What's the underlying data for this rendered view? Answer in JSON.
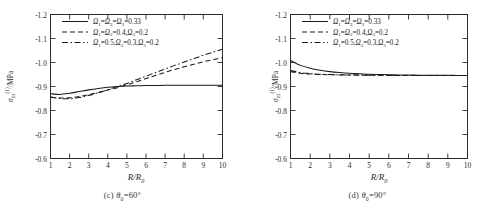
{
  "figure": {
    "panels": [
      {
        "id": "panel-c",
        "caption_prefix": "(c)",
        "caption_symbol": "θ",
        "caption_sub": "0",
        "caption_value": "=60°",
        "caption_full": "(c) θ0=60°",
        "axes": {
          "xlabel": "R/R",
          "xlabel_sub": "0",
          "ylabel_sigma": "σ",
          "ylabel_sub": "zz",
          "ylabel_sup": "(1)",
          "ylabel_unit": "/MPa",
          "ylabel_full": "σzz(1)/MPa",
          "xticks": [
            "1",
            "2",
            "3",
            "4",
            "5",
            "6",
            "7",
            "8",
            "9",
            "10"
          ],
          "yticks": [
            "-1.2",
            "-1.1",
            "-1.0",
            "-0.9",
            "-0.8",
            "-0.7",
            "-0.6"
          ],
          "xlim": [
            1,
            10
          ],
          "ylim": [
            -1.2,
            -0.6
          ]
        },
        "legend": [
          {
            "style": "solid",
            "text": "Ω1=Ω2=Ω3=0.33"
          },
          {
            "style": "dashed",
            "text": "Ω1=Ω2=0.4,Ω3=0.2"
          },
          {
            "style": "dashdot",
            "text": "Ω1=0.5,Ω2=0.3,Ω3=0.2"
          }
        ]
      },
      {
        "id": "panel-d",
        "caption_prefix": "(d)",
        "caption_symbol": "θ",
        "caption_sub": "0",
        "caption_value": "=90°",
        "caption_full": "(d) θ0=90°",
        "axes": {
          "xlabel": "R/R",
          "xlabel_sub": "0",
          "ylabel_sigma": "σ",
          "ylabel_sub": "zz",
          "ylabel_sup": "(1)",
          "ylabel_unit": "/MPa",
          "ylabel_full": "σzz(1)/MPa",
          "xticks": [
            "1",
            "2",
            "3",
            "4",
            "5",
            "6",
            "7",
            "8",
            "9",
            "10"
          ],
          "yticks": [
            "-1.2",
            "-1.1",
            "-1.0",
            "-0.9",
            "-0.8",
            "-0.7",
            "-0.6"
          ],
          "xlim": [
            1,
            10
          ],
          "ylim": [
            -1.2,
            -0.6
          ]
        },
        "legend": [
          {
            "style": "solid",
            "text": "Ω1=Ω2=Ω3=0.33"
          },
          {
            "style": "dashed",
            "text": "Ω1=Ω2=0.4,Ω3=0.2"
          },
          {
            "style": "dashdot",
            "text": "Ω1=0.5,Ω2=0.3,Ω3=0.2"
          }
        ]
      }
    ]
  },
  "chart_data": [
    {
      "type": "line",
      "title": "(c) θ0=60°",
      "xlabel": "R/R0",
      "ylabel": "σzz(1)/MPa",
      "xlim": [
        1,
        10
      ],
      "ylim": [
        -1.2,
        -0.6
      ],
      "grid": false,
      "legend_position": "upper-center",
      "x": [
        1,
        1.5,
        2,
        2.5,
        3,
        3.5,
        4,
        4.5,
        5,
        5.5,
        6,
        6.5,
        7,
        7.5,
        8,
        8.5,
        9,
        9.5,
        10
      ],
      "series": [
        {
          "name": "Ω1=Ω2=Ω3=0.33",
          "style": "solid",
          "values": [
            -0.93,
            -0.933,
            -0.928,
            -0.921,
            -0.914,
            -0.908,
            -0.903,
            -0.9,
            -0.898,
            -0.897,
            -0.896,
            -0.896,
            -0.895,
            -0.895,
            -0.895,
            -0.895,
            -0.895,
            -0.895,
            -0.895
          ]
        },
        {
          "name": "Ω1=Ω2=0.4,Ω3=0.2",
          "style": "dashed",
          "values": [
            -0.945,
            -0.948,
            -0.947,
            -0.942,
            -0.934,
            -0.925,
            -0.915,
            -0.905,
            -0.893,
            -0.88,
            -0.867,
            -0.854,
            -0.841,
            -0.829,
            -0.818,
            -0.807,
            -0.797,
            -0.788,
            -0.78
          ]
        },
        {
          "name": "Ω1=0.5,Ω2=0.3,Ω3=0.2",
          "style": "dashdot",
          "values": [
            -0.943,
            -0.95,
            -0.951,
            -0.946,
            -0.937,
            -0.926,
            -0.913,
            -0.9,
            -0.887,
            -0.872,
            -0.857,
            -0.842,
            -0.827,
            -0.812,
            -0.798,
            -0.784,
            -0.77,
            -0.757,
            -0.745
          ]
        }
      ]
    },
    {
      "type": "line",
      "title": "(d) θ0=90°",
      "xlabel": "R/R0",
      "ylabel": "σzz(1)/MPa",
      "xlim": [
        1,
        10
      ],
      "ylim": [
        -1.2,
        -0.6
      ],
      "grid": false,
      "legend_position": "upper-center",
      "x": [
        1,
        1.5,
        2,
        2.5,
        3,
        3.5,
        4,
        4.5,
        5,
        5.5,
        6,
        6.5,
        7,
        7.5,
        8,
        8.5,
        9,
        9.5,
        10
      ],
      "series": [
        {
          "name": "Ω1=Ω2=Ω3=0.33",
          "style": "solid",
          "values": [
            -0.792,
            -0.812,
            -0.824,
            -0.832,
            -0.838,
            -0.842,
            -0.845,
            -0.847,
            -0.849,
            -0.85,
            -0.851,
            -0.852,
            -0.852,
            -0.853,
            -0.853,
            -0.853,
            -0.853,
            -0.854,
            -0.854
          ]
        },
        {
          "name": "Ω1=Ω2=0.4,Ω3=0.2",
          "style": "dashed",
          "values": [
            -0.838,
            -0.845,
            -0.848,
            -0.85,
            -0.851,
            -0.852,
            -0.852,
            -0.853,
            -0.853,
            -0.853,
            -0.854,
            -0.854,
            -0.854,
            -0.854,
            -0.854,
            -0.854,
            -0.854,
            -0.854,
            -0.854
          ]
        },
        {
          "name": "Ω1=0.5,Ω2=0.3,Ω3=0.2",
          "style": "dashdot",
          "values": [
            -0.833,
            -0.842,
            -0.846,
            -0.849,
            -0.85,
            -0.851,
            -0.852,
            -0.852,
            -0.853,
            -0.853,
            -0.853,
            -0.854,
            -0.854,
            -0.854,
            -0.854,
            -0.854,
            -0.854,
            -0.854,
            -0.854
          ]
        }
      ]
    }
  ]
}
